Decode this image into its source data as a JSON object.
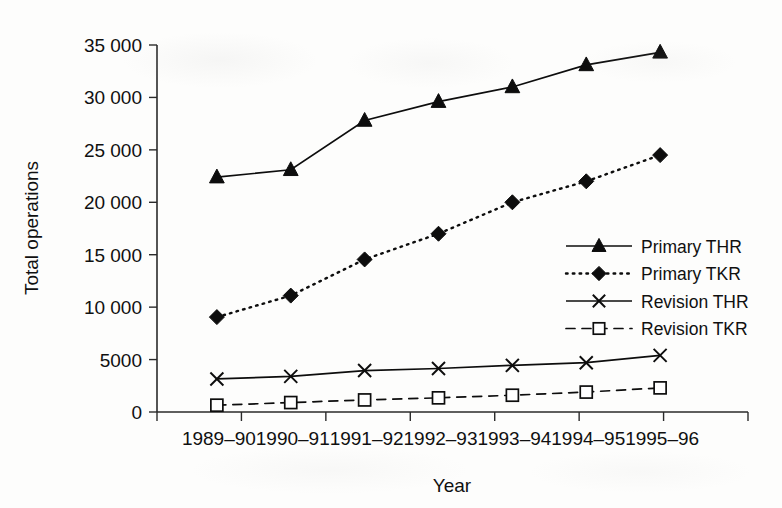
{
  "chart_data": {
    "type": "line",
    "title": "",
    "xlabel": "Year",
    "ylabel": "Total operations",
    "categories": [
      "1989–90",
      "1990–91",
      "1991–92",
      "1992–93",
      "1993–94",
      "1994–95",
      "1995–96"
    ],
    "ylim": [
      0,
      35000
    ],
    "yticks": [
      0,
      5000,
      10000,
      15000,
      20000,
      25000,
      30000,
      35000
    ],
    "ytick_labels": [
      "0",
      "5000",
      "10 000",
      "15 000",
      "20 000",
      "25 000",
      "30 000",
      "35 000"
    ],
    "grid": false,
    "legend_position": "right-middle",
    "series": [
      {
        "name": "Primary THR",
        "marker": "filled-triangle",
        "line_style": "solid",
        "values": [
          22400,
          23100,
          27800,
          29600,
          31000,
          33100,
          34300
        ]
      },
      {
        "name": "Primary TKR",
        "marker": "filled-diamond",
        "line_style": "dotted",
        "values": [
          9050,
          11100,
          14550,
          17000,
          20000,
          22000,
          24500
        ]
      },
      {
        "name": "Revision THR",
        "marker": "cross",
        "line_style": "solid",
        "values": [
          3150,
          3400,
          3950,
          4150,
          4450,
          4700,
          5400
        ]
      },
      {
        "name": "Revision TKR",
        "marker": "open-square",
        "line_style": "dashed",
        "values": [
          650,
          900,
          1150,
          1350,
          1600,
          1900,
          2300
        ]
      }
    ]
  },
  "colors": {
    "ink": "#0d0d0d",
    "axis": "#2a2a2a",
    "background": "#fdfdfc"
  }
}
